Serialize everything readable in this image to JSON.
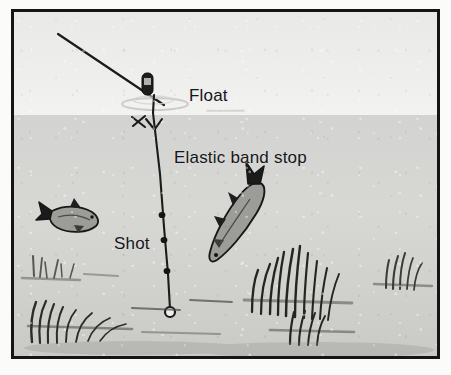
{
  "figure": {
    "frame_color": "#151515",
    "background_color": "#d9d9d7"
  },
  "scene": {
    "sky_color": "#ecece b",
    "water_color": "#d3d3d1",
    "surface_label": "water-surface"
  },
  "labels": {
    "float": "Float",
    "elastic_band_stop": "Elastic band stop",
    "shot": "Shot"
  },
  "components": {
    "line": {
      "name": "fishing-line",
      "color": "#1a1a1a",
      "from": "top-left corner",
      "to": "hook at lake bed"
    },
    "float": {
      "name": "float",
      "color": "#1c1c1c",
      "shape": "rounded-rectangle"
    },
    "elastic_band_stop": {
      "name": "elastic-band-stop",
      "color": "#1a1a1a",
      "shape": "y-knot-with-tag-end"
    },
    "shot": {
      "name": "split-shot",
      "color": "#141414",
      "count": 3
    },
    "hook": {
      "name": "hook-bait",
      "color": "#1a1a1a",
      "shape": "small-circle"
    }
  },
  "wildlife": {
    "fish": [
      {
        "name": "fish-small-left",
        "orientation": "head-down-right",
        "color": "#9a9a98"
      },
      {
        "name": "fish-large-right",
        "orientation": "head-down-left",
        "color": "#9a9a98"
      }
    ]
  },
  "vegetation": {
    "clumps": [
      {
        "name": "weed-clump-left-upper"
      },
      {
        "name": "weed-clump-left-lower"
      },
      {
        "name": "weed-clump-center"
      },
      {
        "name": "weed-clump-right-main"
      },
      {
        "name": "weed-clump-far-right"
      }
    ]
  }
}
